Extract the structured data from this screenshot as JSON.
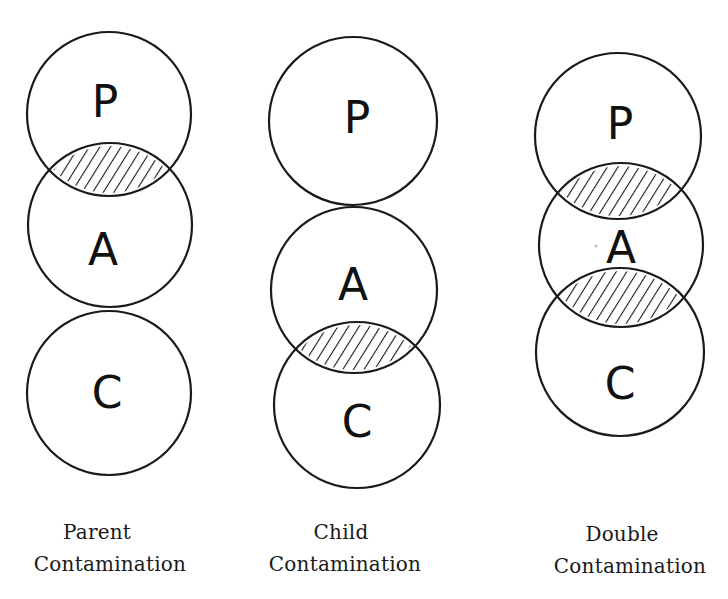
{
  "title_fragment": "g",
  "diagrams": [
    {
      "id": "parent",
      "caption_line1": "Parent",
      "caption_line2": "Contamination",
      "circles": [
        {
          "label": "P",
          "cx": 109,
          "cy": 114,
          "r": 82
        },
        {
          "label": "A",
          "cx": 110,
          "cy": 225,
          "r": 82
        },
        {
          "label": "C",
          "cx": 109,
          "cy": 393,
          "r": 82
        }
      ],
      "hatched_overlaps": [
        "P∩A"
      ]
    },
    {
      "id": "child",
      "caption_line1": "Child",
      "caption_line2": "Contamination",
      "circles": [
        {
          "label": "P",
          "cx": 353,
          "cy": 121,
          "r": 84
        },
        {
          "label": "A",
          "cx": 354,
          "cy": 290,
          "r": 83
        },
        {
          "label": "C",
          "cx": 357,
          "cy": 405,
          "r": 83
        }
      ],
      "hatched_overlaps": [
        "A∩C"
      ]
    },
    {
      "id": "double",
      "caption_line1": "Double",
      "caption_line2": "Contamination",
      "circles": [
        {
          "label": "P",
          "cx": 618,
          "cy": 136,
          "r": 83
        },
        {
          "label": "A",
          "cx": 621,
          "cy": 245,
          "r": 82
        },
        {
          "label": "C",
          "cx": 620,
          "cy": 352,
          "r": 84
        }
      ],
      "hatched_overlaps": [
        "P∩A",
        "A∩C"
      ]
    }
  ],
  "colors": {
    "stroke": "#1a1a1a",
    "background": "#ffffff"
  }
}
